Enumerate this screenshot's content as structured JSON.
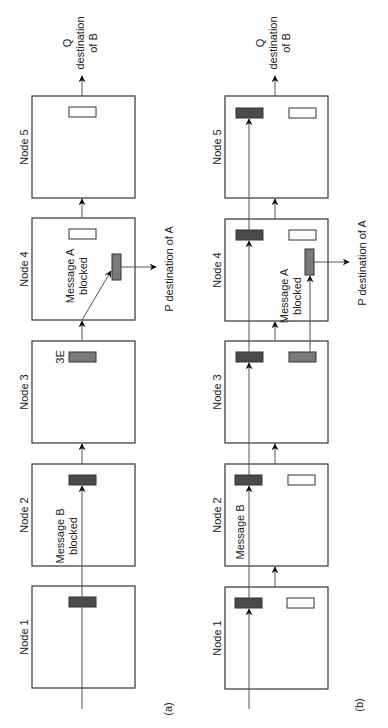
{
  "figure": {
    "panels": [
      {
        "id": "a",
        "caption": "(a)",
        "nodes": [
          "Node 1",
          "Node 2",
          "Node 3",
          "Node 4",
          "Node 5"
        ],
        "annotations": {
          "message_b_line1": "Message B",
          "message_b_line2": "blocked",
          "message_a_line1": "Message A",
          "message_a_line2": "blocked",
          "buffer_label": "3E",
          "dest_a": "P destination of A",
          "dest_b_line1": "Q",
          "dest_b_line2": "destination",
          "dest_b_line3": "of B"
        }
      },
      {
        "id": "b",
        "caption": "(b)",
        "nodes": [
          "Node 1",
          "Node 2",
          "Node 3",
          "Node 4",
          "Node 5"
        ],
        "annotations": {
          "message_b_line1": "Message B",
          "message_a_line1": "Message A",
          "message_a_line2": "blocked",
          "dest_a": "P destination of A",
          "dest_b_line1": "Q",
          "dest_b_line2": "destination",
          "dest_b_line3": "of B"
        }
      }
    ],
    "colors": {
      "dark_buffer": "#4a4a4a",
      "mid_buffer": "#7a7a7a",
      "empty_buffer": "#ffffff",
      "line": "#333333"
    }
  }
}
